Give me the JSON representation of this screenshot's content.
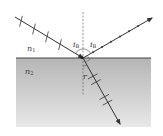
{
  "diagram": {
    "media": {
      "upper": {
        "label": "n",
        "subscript": "1"
      },
      "lower": {
        "label": "n",
        "subscript": "2"
      }
    },
    "angles": {
      "incident": {
        "label": "i",
        "subscript": "B"
      },
      "reflected": {
        "label": "i",
        "subscript": "B"
      },
      "refracted": {
        "label": "r"
      }
    },
    "rays": [
      {
        "name": "incident-ray",
        "from": [
          15,
          17
        ],
        "to": [
          83,
          58
        ],
        "polarization_marks": "perpendicular-ticks"
      },
      {
        "name": "reflected-ray",
        "from": [
          83,
          58
        ],
        "to": [
          152,
          18
        ],
        "polarization_marks": "dots"
      },
      {
        "name": "refracted-ray",
        "from": [
          83,
          58
        ],
        "to": [
          120,
          124
        ],
        "polarization_marks": "perpendicular-ticks"
      }
    ],
    "colors": {
      "line": "#333333",
      "medium2_top": "#b8b8b8",
      "medium2_bottom": "#e6e6e6",
      "interface": "#444444"
    }
  }
}
